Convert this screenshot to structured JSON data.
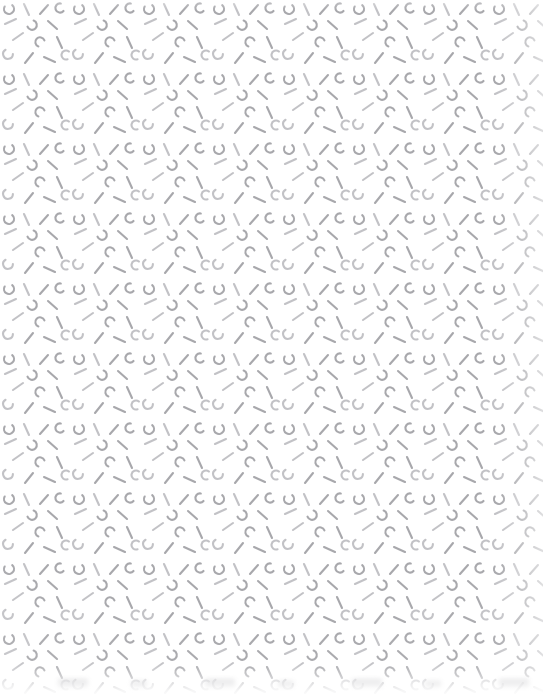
{
  "canvas": {
    "width": 543,
    "height": 698,
    "background_color": "#ffffff",
    "description": "Seamless decorative confetti pattern of short grey strokes on a white background"
  },
  "pattern": {
    "name": "stroke-confetti",
    "tile_width": 70,
    "tile_height": 70,
    "stroke_color": "#a8a8ac",
    "stroke_color_light": "#c2c2c6",
    "stroke_width": 2.1,
    "stroke_linecap": "round",
    "motifs": [
      "straight-segment",
      "diagonal-segment",
      "c-arc",
      "j-hook",
      "quarter-arc",
      "dash"
    ],
    "elements": [
      {
        "type": "arc",
        "x": 9,
        "y": 9,
        "r": 5.0,
        "a0": 40,
        "a1": 300
      },
      {
        "type": "line",
        "x1": 24,
        "y1": 4,
        "x2": 29,
        "y2": 15
      },
      {
        "type": "line",
        "x1": 40,
        "y1": 14,
        "x2": 48,
        "y2": 5
      },
      {
        "type": "arc",
        "x": 60,
        "y": 8,
        "r": 4.6,
        "a0": 130,
        "a1": 370
      },
      {
        "type": "line",
        "x1": 5,
        "y1": 24,
        "x2": 16,
        "y2": 19
      },
      {
        "type": "arc",
        "x": 32,
        "y": 25,
        "r": 4.8,
        "a0": 20,
        "a1": 250
      },
      {
        "type": "line",
        "x1": 48,
        "y1": 21,
        "x2": 57,
        "y2": 29
      },
      {
        "type": "line",
        "x1": 13,
        "y1": 40,
        "x2": 23,
        "y2": 33
      },
      {
        "type": "arc",
        "x": 40,
        "y": 42,
        "r": 4.7,
        "a0": 200,
        "a1": 430
      },
      {
        "type": "line",
        "x1": 57,
        "y1": 37,
        "x2": 62,
        "y2": 48
      },
      {
        "type": "arc",
        "x": 8,
        "y": 54,
        "r": 4.9,
        "a0": 90,
        "a1": 330
      },
      {
        "type": "line",
        "x1": 25,
        "y1": 63,
        "x2": 33,
        "y2": 53
      },
      {
        "type": "line",
        "x1": 44,
        "y1": 57,
        "x2": 55,
        "y2": 62
      },
      {
        "type": "arc",
        "x": 66,
        "y": 55,
        "r": 4.5,
        "a0": 160,
        "a1": 400
      }
    ]
  },
  "effects": {
    "bottom_fade": {
      "height": 34,
      "color": "#ffffff"
    },
    "right_fade": {
      "width": 46,
      "color": "#ffffff"
    },
    "bottom_smudge_opacity": 0.55
  }
}
